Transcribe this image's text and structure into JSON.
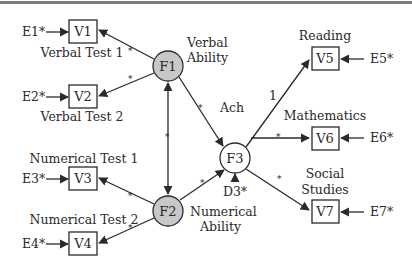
{
  "diagram": {
    "type": "structural-equation-model",
    "colors": {
      "latent_exogenous_fill": "#c8c8c8",
      "latent_endogenous_fill": "#ffffff",
      "stroke": "#2a2a2a",
      "top_rule": "#7a7a7a"
    },
    "observed": [
      {
        "id": "V1",
        "label": "V1",
        "caption": "Verbal Test 1",
        "error": "E1*"
      },
      {
        "id": "V2",
        "label": "V2",
        "caption": "Verbal Test 2",
        "error": "E2*"
      },
      {
        "id": "V3",
        "label": "V3",
        "caption": "Numerical Test 1",
        "error": "E3*"
      },
      {
        "id": "V4",
        "label": "V4",
        "caption": "Numerical Test 2",
        "error": "E4*"
      },
      {
        "id": "V5",
        "label": "V5",
        "caption": "Reading",
        "error": "E5*"
      },
      {
        "id": "V6",
        "label": "V6",
        "caption": "Mathematics",
        "error": "E6*"
      },
      {
        "id": "V7",
        "label": "V7",
        "caption_line1": "Social",
        "caption_line2": "Studies",
        "error": "E7*"
      }
    ],
    "latent": [
      {
        "id": "F1",
        "label": "F1",
        "caption_line1": "Verbal",
        "caption_line2": "Ability"
      },
      {
        "id": "F2",
        "label": "F2",
        "caption_line1": "Numerical",
        "caption_line2": "Ability"
      },
      {
        "id": "F3",
        "label": "F3",
        "caption": "Ach",
        "disturbance": "D3*"
      }
    ],
    "paths": [
      {
        "from": "F1",
        "to": "V1",
        "coef": "*"
      },
      {
        "from": "F1",
        "to": "V2",
        "coef": "*"
      },
      {
        "from": "F2",
        "to": "V3",
        "coef": "*"
      },
      {
        "from": "F2",
        "to": "V4",
        "coef": "*"
      },
      {
        "from": "F1",
        "to": "F2",
        "coef": "*",
        "bidirectional": true
      },
      {
        "from": "F1",
        "to": "F3",
        "coef": "*"
      },
      {
        "from": "F2",
        "to": "F3",
        "coef": "*"
      },
      {
        "from": "F3",
        "to": "V5",
        "coef": "1"
      },
      {
        "from": "F3",
        "to": "V6",
        "coef": "*"
      },
      {
        "from": "F3",
        "to": "V7",
        "coef": "*"
      }
    ],
    "coef_labels": {
      "star": "*",
      "one": "1"
    }
  }
}
